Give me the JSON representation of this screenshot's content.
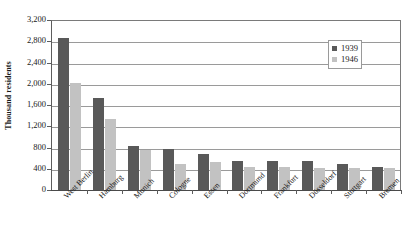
{
  "chart_data": {
    "type": "bar",
    "title": "",
    "subtitle": "",
    "xlabel": "",
    "ylabel": "Thousand residents",
    "ylim": [
      0,
      3200
    ],
    "ytick_step": 400,
    "grid": true,
    "legend_position": "top-right",
    "categories": [
      "West Berlin",
      "Hamburg",
      "Munich",
      "Cologne",
      "Essen",
      "Dortmund",
      "Frankfurt",
      "Düsseldorf",
      "Stuttgart",
      "Bremen"
    ],
    "ytick_labels": [
      "3,200",
      "2,800",
      "2,400",
      "2,000",
      "1,600",
      "1,200",
      "800",
      "400",
      "0"
    ],
    "ytick_values": [
      3200,
      2800,
      2400,
      2000,
      1600,
      1200,
      800,
      400,
      0
    ],
    "series": [
      {
        "name": "1939",
        "color": "#595959",
        "values": [
          2870,
          1730,
          830,
          770,
          670,
          540,
          550,
          540,
          490,
          440
        ]
      },
      {
        "name": "1946",
        "color": "#c2c2c2",
        "values": [
          2010,
          1340,
          750,
          490,
          530,
          430,
          430,
          420,
          420,
          420
        ]
      }
    ]
  },
  "legend": {
    "entries": [
      {
        "label": "1939",
        "color": "#595959"
      },
      {
        "label": "1946",
        "color": "#c2c2c2"
      }
    ]
  }
}
